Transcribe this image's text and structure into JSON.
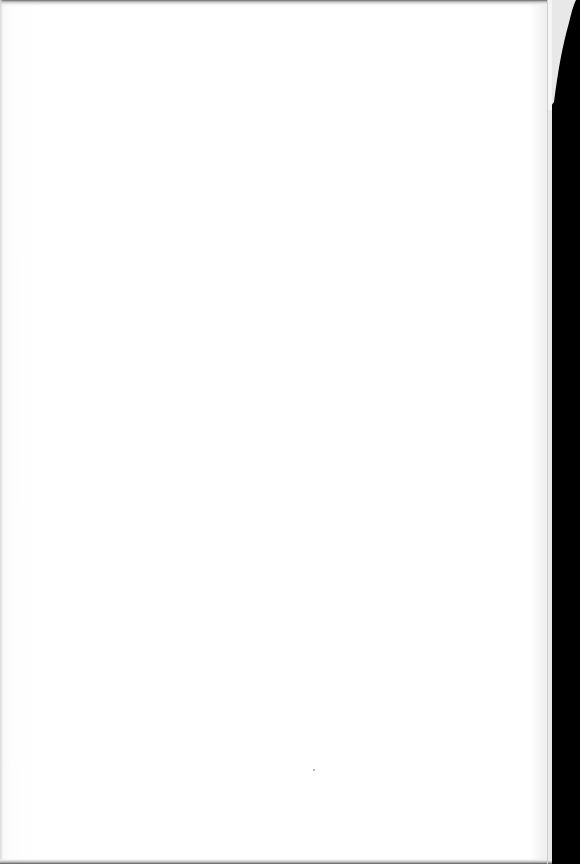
{
  "document": {
    "type": "scanned-page",
    "content": "blank",
    "text": "",
    "colors": {
      "paper": "#ffffff",
      "edge_shadow": "#e4e4e4",
      "background": "#000000"
    }
  }
}
